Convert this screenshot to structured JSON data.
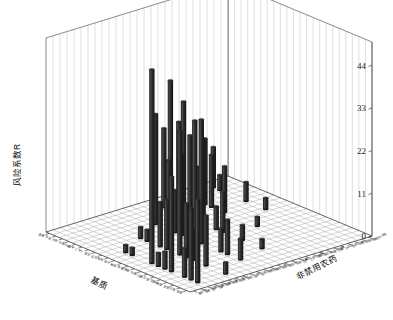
{
  "figure": {
    "background_color": "#ffffff",
    "bar_color": "#333333",
    "bar_color_light": "#5a5a5a",
    "bar_color_dark": "#1b1b1b",
    "wall_color": "#ffffff",
    "grid_color": "#b9b9b9",
    "axis_color": "#2e2e2e"
  },
  "chart_data": {
    "type": "bar",
    "title": "",
    "subtitle": "",
    "projection": "3d",
    "zlabel": "风险系数R",
    "xlabel": "基质",
    "ylabel": "非禁用农药",
    "zticks": [
      0,
      11,
      22,
      33,
      44
    ],
    "ztick_labels": [
      "0",
      "11",
      "22",
      "33",
      "44"
    ],
    "zlim": [
      0,
      50
    ],
    "grid": true,
    "legend": null,
    "annotations": [],
    "x_categories": [
      "菠菜",
      "芹菜",
      "韭菜",
      "油麦菜",
      "生菜",
      "小白菜",
      "大白菜",
      "甘蓝",
      "花椰菜",
      "黄瓜",
      "番茄",
      "茄子",
      "辣椒",
      "豇豆",
      "菜豆",
      "萝卜",
      "胡萝卜",
      "马铃薯",
      "洋葱",
      "大蒜",
      "生姜",
      "莲藕"
    ],
    "y_categories": [
      "毒死蜱",
      "氯氰菊酯",
      "氰戊菊酯",
      "溴氰菊酯",
      "联苯菊酯",
      "甲氰菊酯",
      "三唑酮",
      "多菌灵",
      "腐霉利",
      "百菌清",
      "嘧霉胺",
      "烯酰吗啉",
      "吡虫啉",
      "啶虫脒",
      "阿维菌素",
      "哒螨灵",
      "乙酰甲胺磷",
      "敌敌畏",
      "氧乐果",
      "甲基异柳磷",
      "乐果",
      "辛硫磷",
      "水胺硫磷",
      "三唑磷",
      "戊唑醇",
      "苯醚甲环唑"
    ],
    "bars": [
      {
        "x": 1,
        "y": 2,
        "z": 21.5
      },
      {
        "x": 2,
        "y": 2,
        "z": 18.5
      },
      {
        "x": 3,
        "y": 2,
        "z": 7.5
      },
      {
        "x": 5,
        "y": 2,
        "z": 24.5
      },
      {
        "x": 6,
        "y": 2,
        "z": 4.5
      },
      {
        "x": 7,
        "y": 2,
        "z": 3.5
      },
      {
        "x": 8,
        "y": 2,
        "z": 50.0
      },
      {
        "x": 11,
        "y": 2,
        "z": 2.0
      },
      {
        "x": 12,
        "y": 2,
        "z": 2.0
      },
      {
        "x": 1,
        "y": 6,
        "z": 3.0
      },
      {
        "x": 4,
        "y": 6,
        "z": 13.0
      },
      {
        "x": 6,
        "y": 6,
        "z": 8.0
      },
      {
        "x": 7,
        "y": 6,
        "z": 14.0
      },
      {
        "x": 8,
        "y": 6,
        "z": 32.0
      },
      {
        "x": 10,
        "y": 6,
        "z": 13.0
      },
      {
        "x": 11,
        "y": 6,
        "z": 11.5
      },
      {
        "x": 13,
        "y": 6,
        "z": 3.0
      },
      {
        "x": 14,
        "y": 6,
        "z": 3.0
      },
      {
        "x": 3,
        "y": 10,
        "z": 5.5
      },
      {
        "x": 5,
        "y": 10,
        "z": 9.0
      },
      {
        "x": 6,
        "y": 10,
        "z": 6.0
      },
      {
        "x": 9,
        "y": 10,
        "z": 32.0
      },
      {
        "x": 10,
        "y": 10,
        "z": 31.0
      },
      {
        "x": 12,
        "y": 10,
        "z": 21.0
      },
      {
        "x": 13,
        "y": 10,
        "z": 11.0
      },
      {
        "x": 14,
        "y": 10,
        "z": 18.0
      },
      {
        "x": 16,
        "y": 10,
        "z": 28.5
      },
      {
        "x": 4,
        "y": 14,
        "z": 2.5
      },
      {
        "x": 7,
        "y": 14,
        "z": 4.0
      },
      {
        "x": 10,
        "y": 14,
        "z": 10.5
      },
      {
        "x": 11,
        "y": 14,
        "z": 6.0
      },
      {
        "x": 13,
        "y": 14,
        "z": 22.0
      },
      {
        "x": 15,
        "y": 14,
        "z": 21.5
      },
      {
        "x": 16,
        "y": 14,
        "z": 29.5
      },
      {
        "x": 18,
        "y": 14,
        "z": 33.5
      },
      {
        "x": 19,
        "y": 14,
        "z": 20.5
      },
      {
        "x": 9,
        "y": 18,
        "z": 2.5
      },
      {
        "x": 14,
        "y": 18,
        "z": 12.0
      },
      {
        "x": 16,
        "y": 18,
        "z": 13.5
      },
      {
        "x": 17,
        "y": 18,
        "z": 17.0
      },
      {
        "x": 18,
        "y": 18,
        "z": 9.0
      },
      {
        "x": 21,
        "y": 18,
        "z": 18.5
      },
      {
        "x": 12,
        "y": 22,
        "z": 3.0
      },
      {
        "x": 15,
        "y": 22,
        "z": 5.0
      },
      {
        "x": 19,
        "y": 22,
        "z": 4.0
      },
      {
        "x": 20,
        "y": 22,
        "z": 10.5
      }
    ]
  }
}
